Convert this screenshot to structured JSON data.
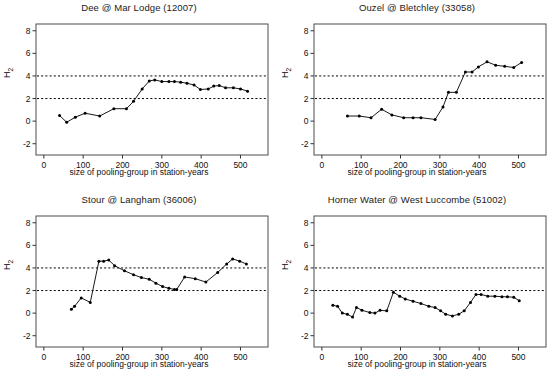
{
  "figure": {
    "background": "#ffffff",
    "line_color": "#1a1a1a",
    "marker_color": "#000000",
    "frame_color": "#4d4d4d",
    "ref_line_color": "#000000"
  },
  "axis": {
    "xlabel": "size of pooling-group in station-years",
    "ylabel_main": "H",
    "ylabel_sub": "2",
    "xticks": [
      0,
      100,
      200,
      300,
      400,
      500
    ],
    "yticks": [
      -2,
      0,
      2,
      4,
      6,
      8
    ],
    "xlim": [
      -20,
      570
    ],
    "ylim": [
      -3,
      8.6
    ],
    "reference_lines": [
      2,
      4
    ],
    "grid": false
  },
  "chart_data": [
    {
      "type": "line",
      "title": "Dee @ Mar Lodge (12007)",
      "xlabel": "size of pooling-group in station-years",
      "ylabel": "H 2",
      "xlim": [
        -20,
        570
      ],
      "ylim": [
        -3,
        8.6
      ],
      "xticks": [
        0,
        100,
        200,
        300,
        400,
        500
      ],
      "yticks": [
        -2,
        0,
        2,
        4,
        6,
        8
      ],
      "reference_lines": [
        2,
        4
      ],
      "grid": false,
      "x": [
        40,
        58,
        80,
        105,
        142,
        178,
        210,
        228,
        250,
        268,
        282,
        300,
        318,
        332,
        348,
        364,
        382,
        398,
        418,
        432,
        446,
        462,
        482,
        500,
        518
      ],
      "values": [
        0.5,
        -0.1,
        0.35,
        0.7,
        0.45,
        1.1,
        1.1,
        1.75,
        2.85,
        3.55,
        3.65,
        3.5,
        3.5,
        3.5,
        3.45,
        3.35,
        3.2,
        2.8,
        2.85,
        3.1,
        3.15,
        2.95,
        2.95,
        2.85,
        2.65
      ]
    },
    {
      "type": "line",
      "title": "Ouzel @ Bletchley (33058)",
      "xlabel": "size of pooling-group in station-years",
      "ylabel": "H 2",
      "xlim": [
        -20,
        570
      ],
      "ylim": [
        -3,
        8.6
      ],
      "xticks": [
        0,
        100,
        200,
        300,
        400,
        500
      ],
      "yticks": [
        -2,
        0,
        2,
        4,
        6,
        8
      ],
      "reference_lines": [
        2,
        4
      ],
      "grid": false,
      "x": [
        65,
        95,
        125,
        152,
        178,
        208,
        232,
        252,
        288,
        308,
        322,
        342,
        365,
        382,
        398,
        420,
        442,
        465,
        488,
        508
      ],
      "values": [
        0.45,
        0.45,
        0.3,
        1.05,
        0.55,
        0.3,
        0.3,
        0.3,
        0.15,
        1.25,
        2.55,
        2.55,
        4.35,
        4.35,
        4.8,
        5.25,
        4.95,
        4.85,
        4.75,
        5.2
      ]
    },
    {
      "type": "line",
      "title": "Stour @ Langham (36006)",
      "xlabel": "size of pooling-group in station-years",
      "ylabel": "H 2",
      "xlim": [
        -20,
        570
      ],
      "ylim": [
        -3,
        8.6
      ],
      "xticks": [
        0,
        100,
        200,
        300,
        400,
        500
      ],
      "yticks": [
        -2,
        0,
        2,
        4,
        6,
        8
      ],
      "reference_lines": [
        2,
        4
      ],
      "grid": false,
      "x": [
        70,
        78,
        95,
        118,
        140,
        152,
        165,
        180,
        205,
        228,
        248,
        268,
        285,
        302,
        318,
        332,
        338,
        358,
        385,
        412,
        442,
        465,
        480,
        498,
        515
      ],
      "values": [
        0.35,
        0.6,
        1.35,
        0.95,
        4.6,
        4.6,
        4.7,
        4.2,
        3.75,
        3.4,
        3.15,
        3.0,
        2.65,
        2.35,
        2.2,
        2.1,
        2.1,
        3.2,
        3.05,
        2.75,
        3.6,
        4.35,
        4.8,
        4.6,
        4.35
      ]
    },
    {
      "type": "line",
      "title": "Horner Water @ West Luccombe (51002)",
      "xlabel": "size of pooling-group in station-years",
      "ylabel": "H 2",
      "xlim": [
        -20,
        570
      ],
      "ylim": [
        -3,
        8.6
      ],
      "xticks": [
        0,
        100,
        200,
        300,
        400,
        500
      ],
      "yticks": [
        -2,
        0,
        2,
        4,
        6,
        8
      ],
      "reference_lines": [
        2,
        4
      ],
      "grid": false,
      "x": [
        28,
        40,
        52,
        65,
        78,
        88,
        102,
        122,
        135,
        148,
        165,
        182,
        198,
        212,
        232,
        252,
        272,
        288,
        302,
        315,
        332,
        348,
        362,
        378,
        392,
        405,
        422,
        440,
        458,
        472,
        488,
        502
      ],
      "values": [
        0.7,
        0.6,
        0.0,
        -0.1,
        -0.35,
        0.5,
        0.25,
        0.05,
        0.0,
        0.25,
        0.2,
        1.85,
        1.5,
        1.25,
        1.05,
        0.85,
        0.6,
        0.5,
        0.2,
        -0.1,
        -0.25,
        -0.1,
        0.2,
        0.95,
        1.65,
        1.65,
        1.5,
        1.5,
        1.45,
        1.45,
        1.4,
        1.1
      ]
    }
  ]
}
